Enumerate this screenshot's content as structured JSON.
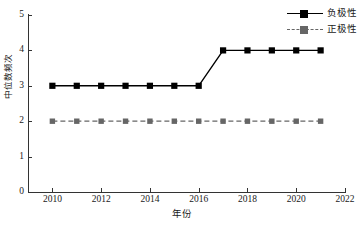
{
  "chart_data": {
    "type": "line",
    "title": "",
    "xlabel": "年份",
    "ylabel": "中位数频次",
    "xlim": [
      2009,
      2022
    ],
    "ylim": [
      0,
      5
    ],
    "xticks": [
      2010,
      2012,
      2014,
      2016,
      2018,
      2020,
      2022
    ],
    "xtick_labels": [
      "2010",
      "2012",
      "2014",
      "2016",
      "2018",
      "2020",
      "2022"
    ],
    "yticks": [
      0,
      1,
      2,
      3,
      4,
      5
    ],
    "ytick_labels": [
      "0",
      "1",
      "2",
      "3",
      "4",
      "5"
    ],
    "grid": false,
    "legend_position": "top-right",
    "x": [
      2010,
      2011,
      2012,
      2013,
      2014,
      2015,
      2016,
      2017,
      2018,
      2019,
      2020,
      2021
    ],
    "series": [
      {
        "name": "负极性",
        "color": "#000000",
        "linestyle": "solid",
        "marker": "square",
        "values": [
          3,
          3,
          3,
          3,
          3,
          3,
          3,
          4,
          4,
          4,
          4,
          4
        ]
      },
      {
        "name": "正极性",
        "color": "#666666",
        "linestyle": "dashed",
        "marker": "square",
        "values": [
          2,
          2,
          2,
          2,
          2,
          2,
          2,
          2,
          2,
          2,
          2,
          2
        ]
      }
    ]
  },
  "legend": {
    "items": [
      {
        "label": "负极性"
      },
      {
        "label": "正极性"
      }
    ]
  },
  "axes": {
    "x_title": "年份",
    "y_title": "中位数频次"
  }
}
